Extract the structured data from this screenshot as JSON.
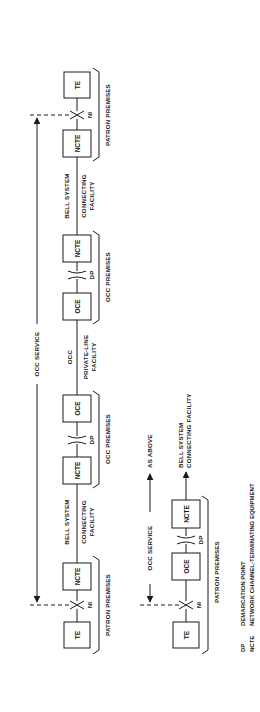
{
  "diagram": {
    "orientation": "rotated-90-ccw",
    "upper_chain": {
      "service_label": "OCC SERVICE",
      "nodes": [
        {
          "id": "te_left",
          "label": "TE"
        },
        {
          "id": "ni_left",
          "label": "NI"
        },
        {
          "id": "ncte_1",
          "label": "NCTE"
        },
        {
          "id": "ncte_2",
          "label": "NCTE"
        },
        {
          "id": "dp_1",
          "label": "DP"
        },
        {
          "id": "oce_1",
          "label": "OCE"
        },
        {
          "id": "oce_2",
          "label": "OCE"
        },
        {
          "id": "dp_2",
          "label": "DP"
        },
        {
          "id": "ncte_3",
          "label": "NCTE"
        },
        {
          "id": "ncte_4",
          "label": "NCTE"
        },
        {
          "id": "ni_right",
          "label": "NI"
        },
        {
          "id": "te_right",
          "label": "TE"
        }
      ],
      "links": [
        {
          "line1": "BELL SYSTEM",
          "line2": "CONNECTING",
          "line3": "FACILITY"
        },
        {
          "line1": "OCC",
          "line2": "PRIVATE-LINE",
          "line3": "FACILITY"
        },
        {
          "line1": "BELL SYSTEM",
          "line2": "CONNECTING",
          "line3": "FACILITY"
        }
      ],
      "premises": [
        "PATRON PREMISES",
        "OCC PREMISES",
        "OCC PREMISES",
        "PATRON PREMISES"
      ]
    },
    "lower_chain": {
      "service_label": "OCC SERVICE",
      "as_above": "AS ABOVE",
      "nodes": [
        {
          "id": "te",
          "label": "TE"
        },
        {
          "id": "ni",
          "label": "NI"
        },
        {
          "id": "oce",
          "label": "OCE"
        },
        {
          "id": "dp",
          "label": "DP"
        },
        {
          "id": "ncte",
          "label": "NCTE"
        }
      ],
      "link": {
        "line1": "BELL SYSTEM",
        "line2": "CONNECTING FACILITY"
      },
      "premises": "PATRON PREMISES"
    },
    "legend": [
      {
        "abbr": "DP",
        "meaning": "DEMARCATION POINT"
      },
      {
        "abbr": "NCTE",
        "meaning": "NETWORK CHANNEL-TERMINATING EQUIPMENT"
      }
    ],
    "colors": {
      "ink": "#1a1a1a",
      "background": "#ffffff"
    }
  }
}
